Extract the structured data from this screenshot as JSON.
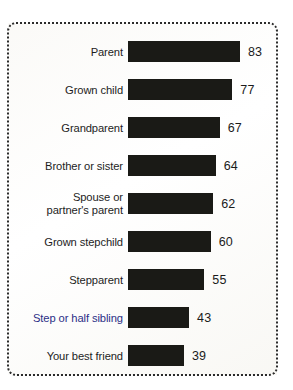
{
  "chart_data": {
    "type": "bar",
    "orientation": "horizontal",
    "title": "",
    "subtitle": "",
    "xlabel": "",
    "ylabel": "",
    "grid": false,
    "legend": null,
    "axis_visible": false,
    "value_labels_shown": true,
    "categories": [
      "Parent",
      "Grown child",
      "Grandparent",
      "Brother or sister",
      "Spouse or\npartner's parent",
      "Grown stepchild",
      "Stepparent",
      "Step or half sibling",
      "Your best friend"
    ],
    "values": [
      83,
      77,
      67,
      64,
      62,
      60,
      55,
      43,
      39
    ],
    "value_suffix": "",
    "xlim": [
      0,
      83
    ],
    "bar_color": "#1a1a16",
    "label_color": "#1d1d1d",
    "accent_label_color": "#2b2f86",
    "accent_label_index": 7,
    "frame_color": "#2b2b2b",
    "background_color": "#ffffff"
  }
}
